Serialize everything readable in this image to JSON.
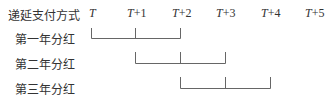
{
  "header_label": "递延支付方式",
  "time_points": [
    {
      "var": "T",
      "suffix": "",
      "x": 90
    },
    {
      "var": "T",
      "suffix": "+1",
      "x": 127
    },
    {
      "var": "T",
      "suffix": "+2",
      "x": 172
    },
    {
      "var": "T",
      "suffix": "+3",
      "x": 216
    },
    {
      "var": "T",
      "suffix": "+4",
      "x": 261
    },
    {
      "var": "T",
      "suffix": "+5",
      "x": 305
    }
  ],
  "rows": [
    {
      "label": "第一年分红",
      "span": [
        0,
        1,
        2
      ]
    },
    {
      "label": "第二年分红",
      "span": [
        1,
        2,
        3
      ]
    },
    {
      "label": "第三年分红",
      "span": [
        2,
        3,
        4
      ]
    }
  ],
  "colors": {
    "line": "#666666",
    "text": "#333333"
  }
}
